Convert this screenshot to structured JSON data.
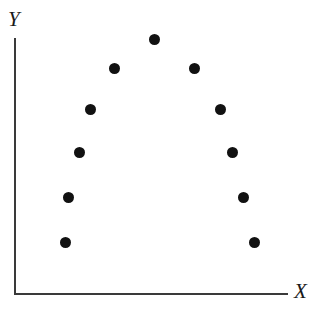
{
  "figure": {
    "background_color": "#ffffff",
    "axis_color": "#3a3a3a",
    "point_color": "#111111",
    "width": 311,
    "height": 317
  },
  "axes": {
    "x_label": "X",
    "y_label": "Y",
    "origin_x_px": 14,
    "origin_y_px": 293,
    "x_axis_end_px": 288,
    "y_axis_top_px": 38
  },
  "chart_data": {
    "type": "scatter",
    "title": "",
    "subtitle": "",
    "xlabel": "X",
    "ylabel": "Y",
    "grid": false,
    "legend": null,
    "legend_position": "none",
    "xlim": [
      0,
      10
    ],
    "ylim": [
      0,
      10
    ],
    "axis_ticks": {
      "x": [],
      "y": []
    },
    "annotations": [],
    "series": [
      {
        "name": "points",
        "marker": "filled-circle",
        "marker_size_px": 11,
        "color": "#111111",
        "points": [
          {
            "index": 1,
            "x": 1.9,
            "y": 2.0,
            "px": 65,
            "py": 242
          },
          {
            "index": 2,
            "x": 2.0,
            "y": 3.8,
            "px": 68,
            "py": 197
          },
          {
            "index": 3,
            "x": 2.4,
            "y": 5.5,
            "px": 79,
            "py": 152
          },
          {
            "index": 4,
            "x": 2.8,
            "y": 7.2,
            "px": 90,
            "py": 109
          },
          {
            "index": 5,
            "x": 3.6,
            "y": 8.8,
            "px": 114,
            "py": 68
          },
          {
            "index": 6,
            "x": 5.1,
            "y": 10.0,
            "px": 154,
            "py": 39
          },
          {
            "index": 7,
            "x": 6.6,
            "y": 8.8,
            "px": 194,
            "py": 68
          },
          {
            "index": 8,
            "x": 7.5,
            "y": 7.2,
            "px": 220,
            "py": 109
          },
          {
            "index": 9,
            "x": 8.0,
            "y": 5.5,
            "px": 232,
            "py": 152
          },
          {
            "index": 10,
            "x": 8.4,
            "y": 3.8,
            "px": 243,
            "py": 197
          },
          {
            "index": 11,
            "x": 8.8,
            "y": 2.0,
            "px": 254,
            "py": 242
          }
        ]
      }
    ]
  }
}
